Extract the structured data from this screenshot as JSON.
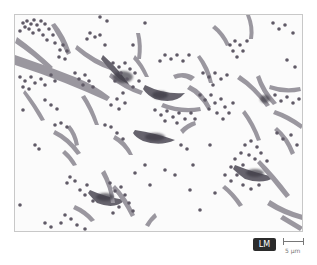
{
  "figure": {
    "badge_label": "LM",
    "scale_bar_label": "5 µm",
    "colors": {
      "background": "#fbfbfb",
      "cocci": "#5f5a66",
      "spindle": "#8a8690",
      "spindle_dark": "#4d4a55",
      "badge_bg": "#2b2b2b",
      "badge_text": "#ffffff",
      "scale": "#777777"
    }
  }
}
